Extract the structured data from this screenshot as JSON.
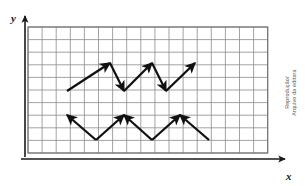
{
  "figure": {
    "axes": {
      "x_label": "x",
      "y_label": "y",
      "x_axis_name": "horizontal-axis",
      "y_axis_name": "vertical-axis"
    },
    "grid": {
      "columns": 17,
      "rows": 10,
      "cell_width": 14.1,
      "cell_height": 12.6,
      "origin_x": 25,
      "origin_y": 153,
      "line_color": "#8c8c8c",
      "line_width": 0.8,
      "border_color": "#6e6e6e",
      "border_width": 1.1
    },
    "style": {
      "axis_color": "#1a1a1a",
      "vector_color": "#111111",
      "vector_width": 2.3,
      "background": "#ffffff"
    },
    "vectors": [
      {
        "name": "vector-1",
        "x1": 67,
        "y1": 91,
        "x2": 110,
        "y2": 63
      },
      {
        "name": "vector-2",
        "x1": 110,
        "y1": 63,
        "x2": 124,
        "y2": 91
      },
      {
        "name": "vector-3",
        "x1": 124,
        "y1": 91,
        "x2": 152,
        "y2": 63
      },
      {
        "name": "vector-4",
        "x1": 152,
        "y1": 63,
        "x2": 166,
        "y2": 91
      },
      {
        "name": "vector-5",
        "x1": 166,
        "y1": 91,
        "x2": 195,
        "y2": 63
      },
      {
        "name": "vector-6",
        "x1": 96,
        "y1": 140,
        "x2": 67,
        "y2": 115
      },
      {
        "name": "vector-7",
        "x1": 96,
        "y1": 140,
        "x2": 124,
        "y2": 115
      },
      {
        "name": "vector-8",
        "x1": 152,
        "y1": 140,
        "x2": 124,
        "y2": 115
      },
      {
        "name": "vector-9",
        "x1": 152,
        "y1": 140,
        "x2": 180,
        "y2": 115
      },
      {
        "name": "vector-10",
        "x1": 209,
        "y1": 140,
        "x2": 180,
        "y2": 115
      }
    ]
  },
  "credit": {
    "line1": "Reprodução/",
    "line2": "Arquivo da editora"
  }
}
